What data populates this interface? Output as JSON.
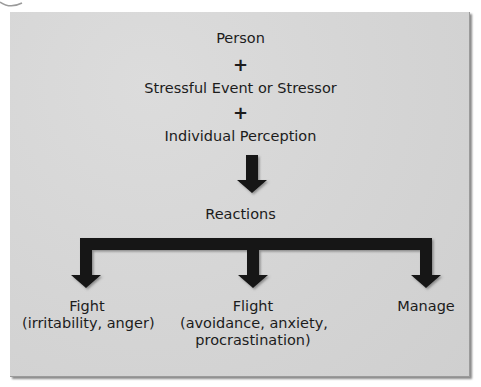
{
  "diagram": {
    "title_items": [
      {
        "label": "Person"
      },
      {
        "label": "+"
      },
      {
        "label": "Stressful Event or Stressor"
      },
      {
        "label": "+"
      },
      {
        "label": "Individual Perception"
      }
    ],
    "middle_node": {
      "label": "Reactions"
    },
    "outcomes": [
      {
        "title": "Fight",
        "detail_lines": [
          "(irritability, anger)"
        ]
      },
      {
        "title": "Flight",
        "detail_lines": [
          "(avoidance, anxiety,",
          "procrastination)"
        ]
      },
      {
        "title": "Manage",
        "detail_lines": []
      }
    ],
    "colors": {
      "panel": "#d6d6d6",
      "arrow": "#141414",
      "text": "#1c1c1c"
    }
  }
}
